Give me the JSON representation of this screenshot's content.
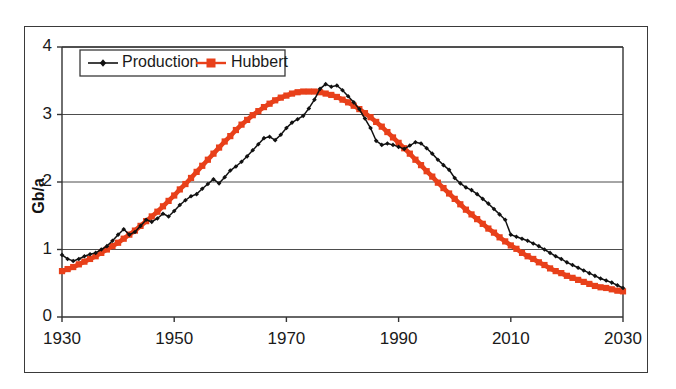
{
  "chart_data": {
    "type": "line",
    "title": "",
    "subtitle": "",
    "xlabel": "",
    "ylabel": "Gb/a",
    "xlim": [
      1930,
      2030
    ],
    "ylim": [
      0,
      4
    ],
    "xticks": [
      1930,
      1950,
      1970,
      1990,
      2010,
      2030
    ],
    "xtick_labels": [
      "1930",
      "1950",
      "1970",
      "1990",
      "2010",
      "2030"
    ],
    "yticks": [
      0,
      1,
      2,
      3,
      4
    ],
    "ytick_labels": [
      "0",
      "1",
      "2",
      "3",
      "4"
    ],
    "grid": "horizontal",
    "legend_position": "top-left-inside",
    "colors": {
      "production": "#111111",
      "hubbert": "#e8401a",
      "frame": "#3a3a3a",
      "gridline": "#4d4d4d",
      "background": "#ffffff"
    },
    "annotations": [
      "Production series shows a discontinuous step up at 2010",
      "Production peak near 1970 at about 3.45 Gb/a",
      "Hubbert curve peak near 1974 at about 3.34 Gb/a"
    ],
    "series": [
      {
        "name": "Production",
        "marker": "diamond",
        "color": "#111111",
        "x": [
          1930,
          1931,
          1932,
          1933,
          1934,
          1935,
          1936,
          1937,
          1938,
          1939,
          1940,
          1941,
          1942,
          1943,
          1944,
          1945,
          1946,
          1947,
          1948,
          1949,
          1950,
          1951,
          1952,
          1953,
          1954,
          1955,
          1956,
          1957,
          1958,
          1959,
          1960,
          1961,
          1962,
          1963,
          1964,
          1965,
          1966,
          1967,
          1968,
          1969,
          1970,
          1971,
          1972,
          1973,
          1974,
          1975,
          1976,
          1977,
          1978,
          1979,
          1980,
          1981,
          1982,
          1983,
          1984,
          1985,
          1986,
          1987,
          1988,
          1989,
          1990,
          1991,
          1992,
          1993,
          1994,
          1995,
          1996,
          1997,
          1998,
          1999,
          2000,
          2001,
          2002,
          2003,
          2004,
          2005,
          2006,
          2007,
          2008,
          2009,
          2010,
          2011,
          2012,
          2013,
          2014,
          2015,
          2016,
          2017,
          2018,
          2019,
          2020,
          2021,
          2022,
          2023,
          2024,
          2025,
          2026,
          2027,
          2028,
          2029,
          2030
        ],
        "y": [
          0.92,
          0.86,
          0.83,
          0.86,
          0.9,
          0.93,
          0.95,
          1.0,
          1.05,
          1.13,
          1.22,
          1.3,
          1.22,
          1.26,
          1.35,
          1.44,
          1.41,
          1.46,
          1.53,
          1.49,
          1.57,
          1.66,
          1.73,
          1.79,
          1.82,
          1.9,
          1.97,
          2.04,
          1.98,
          2.07,
          2.17,
          2.23,
          2.3,
          2.38,
          2.47,
          2.56,
          2.65,
          2.67,
          2.62,
          2.7,
          2.8,
          2.88,
          2.93,
          2.98,
          3.09,
          3.22,
          3.38,
          3.45,
          3.41,
          3.43,
          3.36,
          3.27,
          3.18,
          3.08,
          2.94,
          2.8,
          2.61,
          2.55,
          2.57,
          2.55,
          2.52,
          2.49,
          2.54,
          2.59,
          2.57,
          2.5,
          2.42,
          2.33,
          2.25,
          2.18,
          2.06,
          1.98,
          1.92,
          1.88,
          1.82,
          1.75,
          1.68,
          1.6,
          1.52,
          1.44,
          1.22,
          1.19,
          1.16,
          1.13,
          1.09,
          1.05,
          1.0,
          0.95,
          0.9,
          0.86,
          0.81,
          0.77,
          0.73,
          0.69,
          0.65,
          0.61,
          0.57,
          0.54,
          0.51,
          0.47,
          0.43
        ]
      },
      {
        "name": "Hubbert",
        "marker": "square",
        "color": "#e8401a",
        "x": [
          1930,
          1931,
          1932,
          1933,
          1934,
          1935,
          1936,
          1937,
          1938,
          1939,
          1940,
          1941,
          1942,
          1943,
          1944,
          1945,
          1946,
          1947,
          1948,
          1949,
          1950,
          1951,
          1952,
          1953,
          1954,
          1955,
          1956,
          1957,
          1958,
          1959,
          1960,
          1961,
          1962,
          1963,
          1964,
          1965,
          1966,
          1967,
          1968,
          1969,
          1970,
          1971,
          1972,
          1973,
          1974,
          1975,
          1976,
          1977,
          1978,
          1979,
          1980,
          1981,
          1982,
          1983,
          1984,
          1985,
          1986,
          1987,
          1988,
          1989,
          1990,
          1991,
          1992,
          1993,
          1994,
          1995,
          1996,
          1997,
          1998,
          1999,
          2000,
          2001,
          2002,
          2003,
          2004,
          2005,
          2006,
          2007,
          2008,
          2009,
          2010,
          2011,
          2012,
          2013,
          2014,
          2015,
          2016,
          2017,
          2018,
          2019,
          2020,
          2021,
          2022,
          2023,
          2024,
          2025,
          2026,
          2027,
          2028,
          2029,
          2030
        ],
        "y": [
          0.68,
          0.71,
          0.74,
          0.78,
          0.82,
          0.86,
          0.9,
          0.95,
          1.0,
          1.05,
          1.1,
          1.16,
          1.22,
          1.28,
          1.35,
          1.42,
          1.49,
          1.56,
          1.64,
          1.72,
          1.8,
          1.89,
          1.97,
          2.06,
          2.15,
          2.24,
          2.33,
          2.42,
          2.51,
          2.6,
          2.68,
          2.77,
          2.85,
          2.92,
          2.99,
          3.05,
          3.11,
          3.16,
          3.21,
          3.25,
          3.28,
          3.31,
          3.33,
          3.34,
          3.34,
          3.34,
          3.33,
          3.31,
          3.29,
          3.26,
          3.22,
          3.18,
          3.13,
          3.08,
          3.02,
          2.96,
          2.89,
          2.82,
          2.74,
          2.66,
          2.58,
          2.5,
          2.42,
          2.33,
          2.25,
          2.16,
          2.08,
          1.99,
          1.91,
          1.83,
          1.75,
          1.67,
          1.59,
          1.52,
          1.45,
          1.38,
          1.31,
          1.25,
          1.18,
          1.12,
          1.06,
          1.01,
          0.95,
          0.9,
          0.86,
          0.81,
          0.77,
          0.72,
          0.68,
          0.65,
          0.61,
          0.58,
          0.55,
          0.52,
          0.49,
          0.46,
          0.44,
          0.43,
          0.41,
          0.39,
          0.38
        ]
      }
    ]
  },
  "legend": {
    "items": [
      {
        "label": "Production",
        "marker": "diamond-line",
        "color": "#111111"
      },
      {
        "label": "Hubbert",
        "marker": "square-line",
        "color": "#e8401a"
      }
    ]
  }
}
